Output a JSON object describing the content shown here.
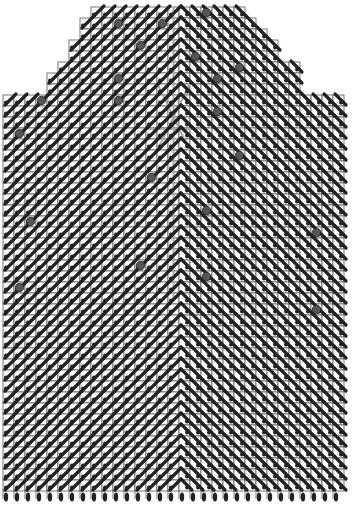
{
  "chart_data": {
    "type": "stitch-chart",
    "title": "",
    "columns": 31,
    "body_rows": 36,
    "neck_rows": 8,
    "neck_shaping": [
      {
        "row_from_top": 0,
        "first_col": 8,
        "last_col": 21
      },
      {
        "row_from_top": 1,
        "first_col": 7,
        "last_col": 22
      },
      {
        "row_from_top": 2,
        "first_col": 7,
        "last_col": 23
      },
      {
        "row_from_top": 3,
        "first_col": 6,
        "last_col": 24
      },
      {
        "row_from_top": 4,
        "first_col": 6,
        "last_col": 24
      },
      {
        "row_from_top": 5,
        "first_col": 5,
        "last_col": 26
      },
      {
        "row_from_top": 6,
        "first_col": 4,
        "last_col": 26
      },
      {
        "row_from_top": 7,
        "first_col": 4,
        "last_col": 26
      }
    ],
    "center_column": 15,
    "left_symbol": "right-leaning-cable",
    "right_symbol": "left-leaning-cable",
    "bead_markers": [
      [
        0,
        18
      ],
      [
        1,
        10
      ],
      [
        1,
        14
      ],
      [
        3,
        12
      ],
      [
        4,
        17
      ],
      [
        5,
        21
      ],
      [
        6,
        10
      ],
      [
        6,
        19
      ],
      [
        8,
        3
      ],
      [
        8,
        10
      ],
      [
        9,
        19
      ],
      [
        11,
        1
      ],
      [
        13,
        21
      ],
      [
        15,
        13
      ],
      [
        18,
        18
      ],
      [
        19,
        2
      ],
      [
        20,
        28
      ],
      [
        23,
        12
      ],
      [
        24,
        18
      ],
      [
        25,
        1
      ],
      [
        27,
        28
      ]
    ],
    "grey_motif": {
      "center_column": 15,
      "rows": [
        7,
        12
      ]
    },
    "bottom_markers": 31,
    "colors": {
      "grid": "#555555",
      "symbol": "#222222",
      "bead": "#555555",
      "motif": "#aaaaaa",
      "background": "#ffffff"
    }
  }
}
